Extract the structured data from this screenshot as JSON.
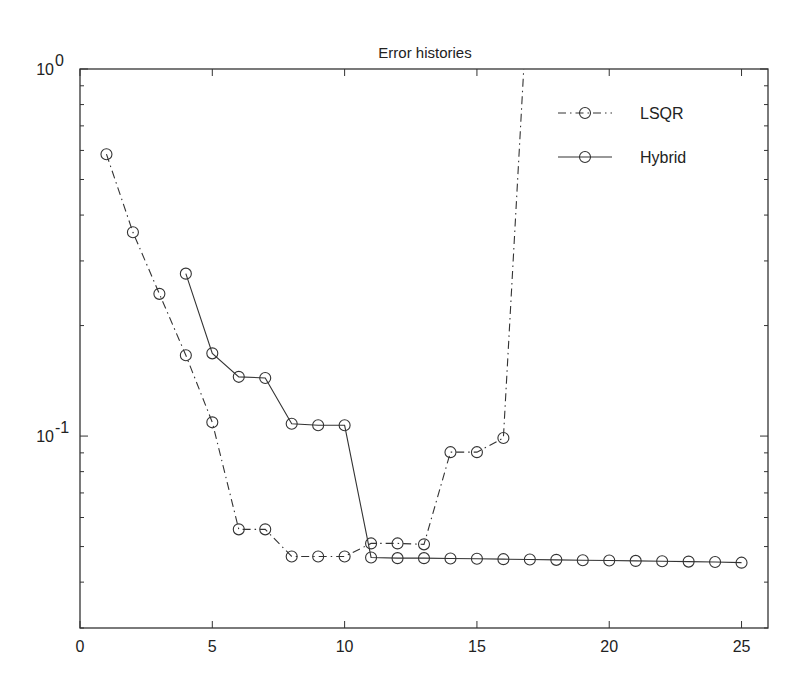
{
  "chart_data": {
    "type": "line",
    "title": "Error histories",
    "xlabel": "",
    "ylabel": "",
    "xscale": "linear",
    "yscale": "log",
    "xlim": [
      0,
      26
    ],
    "ylim": [
      0.03,
      1
    ],
    "xticks": [
      0,
      5,
      10,
      15,
      20,
      25
    ],
    "xtick_labels": [
      "0",
      "5",
      "10",
      "15",
      "20",
      "25"
    ],
    "yticks": [
      0.1,
      1
    ],
    "ytick_labels": [
      {
        "base": "10",
        "exp": "-1"
      },
      {
        "base": "10",
        "exp": "0"
      }
    ],
    "grid": false,
    "legend_position": "upper right",
    "series": [
      {
        "name": "LSQR",
        "line_style": "dash-dot",
        "marker": "circle",
        "x": [
          1,
          2,
          3,
          4,
          5,
          6,
          7,
          8,
          9,
          10,
          11,
          12,
          13,
          14,
          15,
          16,
          17
        ],
        "values": [
          0.586,
          0.359,
          0.244,
          0.166,
          0.109,
          0.0557,
          0.0557,
          0.047,
          0.047,
          0.047,
          0.051,
          0.051,
          0.0507,
          0.0904,
          0.0904,
          0.0988,
          2.0
        ],
        "note": "point at x=17 exceeds upper axis limit (off-chart)"
      },
      {
        "name": "Hybrid",
        "line_style": "solid",
        "marker": "circle",
        "x": [
          4,
          5,
          6,
          7,
          8,
          9,
          10,
          11,
          12,
          13,
          14,
          15,
          16,
          17,
          18,
          19,
          20,
          21,
          22,
          23,
          24,
          25
        ],
        "values": [
          0.277,
          0.168,
          0.145,
          0.144,
          0.108,
          0.107,
          0.107,
          0.0467,
          0.0465,
          0.0465,
          0.0464,
          0.0463,
          0.0462,
          0.0461,
          0.046,
          0.0459,
          0.0458,
          0.0457,
          0.0456,
          0.0455,
          0.0454,
          0.0452
        ]
      }
    ]
  },
  "legend": {
    "items": [
      {
        "label": "LSQR"
      },
      {
        "label": "Hybrid"
      }
    ]
  }
}
